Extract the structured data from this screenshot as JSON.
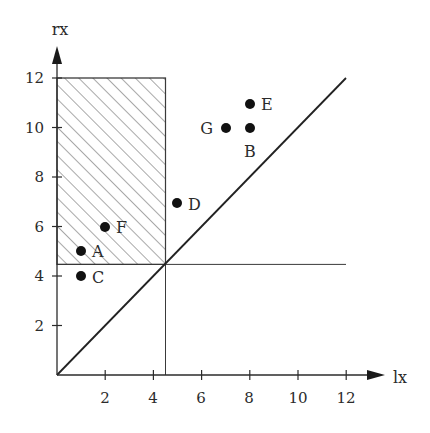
{
  "diagram": {
    "x_axis": {
      "label": "lx",
      "ticks": [
        "2",
        "4",
        "6",
        "8",
        "10",
        "12"
      ]
    },
    "y_axis": {
      "label": "rx",
      "ticks": [
        "2",
        "4",
        "6",
        "8",
        "10",
        "12"
      ]
    },
    "threshold": 4.5,
    "diagonal": {
      "from": [
        0,
        0
      ],
      "to": [
        12,
        12
      ]
    },
    "shaded_region": {
      "x": [
        0,
        4.5
      ],
      "y": [
        4.5,
        12
      ],
      "fill": "hatched"
    },
    "points": [
      {
        "label": "A",
        "x": 1,
        "y": 5
      },
      {
        "label": "B",
        "x": 8,
        "y": 10
      },
      {
        "label": "C",
        "x": 1,
        "y": 4
      },
      {
        "label": "D",
        "x": 5,
        "y": 7
      },
      {
        "label": "E",
        "x": 8,
        "y": 11
      },
      {
        "label": "F",
        "x": 2,
        "y": 6
      },
      {
        "label": "G",
        "x": 7,
        "y": 10
      }
    ],
    "colors": {
      "ink": "#2b2b2b",
      "hatch": "#6e6e6e",
      "background": "#ffffff"
    }
  }
}
